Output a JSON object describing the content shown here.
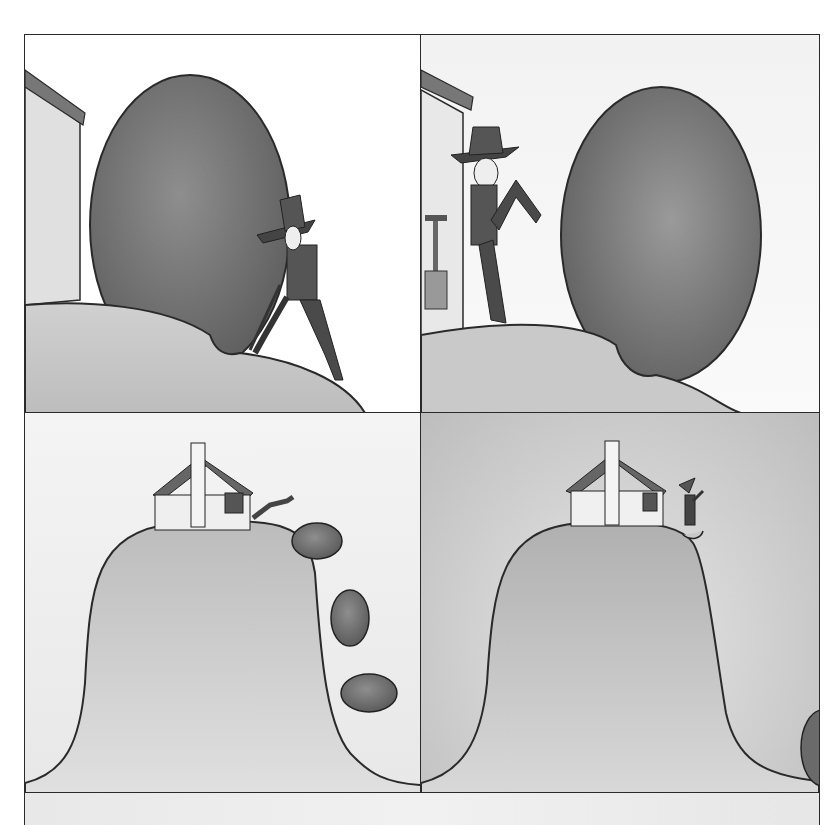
{
  "comic": {
    "layout": "2x2 grid of illustrated panels with partial fifth panel strip at bottom",
    "text_present": false,
    "panels": [
      {
        "id": 1,
        "scene": "man-digging-under-giant-egg-boulder-beside-house-on-hill"
      },
      {
        "id": 2,
        "scene": "man-kicking-giant-egg-boulder-away-from-house"
      },
      {
        "id": 3,
        "scene": "boulder-rolling-down-steep-hill-leaving-house-on-top"
      },
      {
        "id": 4,
        "scene": "man-celebrating-beside-house-on-bell-shaped-hill-boulder-at-bottom-right"
      },
      {
        "id": 5,
        "scene": "partial-next-panel-blank-gray"
      }
    ],
    "colors": {
      "outline": "#2a2a2a",
      "boulder": "#7a7a7a",
      "hill": "#c4c4c4",
      "background": "#ffffff"
    }
  }
}
